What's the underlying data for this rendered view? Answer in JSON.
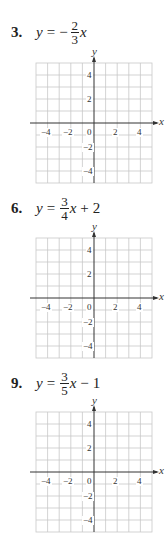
{
  "problems": [
    {
      "number": "3.",
      "lhs": "y",
      "equals": "=",
      "sign": "−",
      "numerator": "2",
      "denominator": "3",
      "xvar": "x",
      "tail_op": "",
      "tail_const": "",
      "top": 16,
      "grid_top": 63
    },
    {
      "number": "6.",
      "lhs": "y",
      "equals": "=",
      "sign": "",
      "numerator": "3",
      "denominator": "4",
      "xvar": "x",
      "tail_op": "+",
      "tail_const": "2",
      "top": 192,
      "grid_top": 239
    },
    {
      "number": "9.",
      "lhs": "y",
      "equals": "=",
      "sign": "",
      "numerator": "3",
      "denominator": "5",
      "xvar": "x",
      "tail_op": "−",
      "tail_const": "1",
      "top": 367,
      "grid_top": 413
    }
  ],
  "grid": {
    "x_label": "x",
    "y_label": "y",
    "x_ticks": [
      "−4",
      "−2",
      "0",
      "2",
      "4"
    ],
    "y_ticks_pos": [
      "4",
      "2"
    ],
    "y_ticks_neg": [
      "−2",
      "−4"
    ],
    "range": [
      -5,
      5
    ],
    "grid_color": "#c8c8c8",
    "axis_color": "#333333"
  }
}
